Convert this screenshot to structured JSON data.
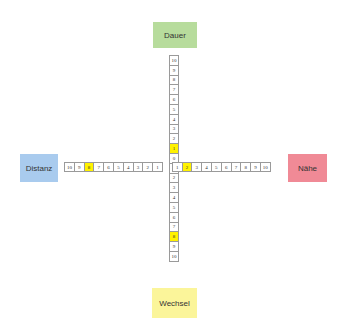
{
  "poles": {
    "top": "Dauer",
    "left": "Distanz",
    "right": "Nähe",
    "bottom": "Wechsel"
  },
  "colors": {
    "top": "#b7dc9c",
    "left": "#a9cbee",
    "right": "#f08a96",
    "bottom": "#fbf59a",
    "highlight": "#fff200"
  },
  "vertical_axis": [
    "10",
    "9",
    "8",
    "7",
    "6",
    "5",
    "4",
    "3",
    "2",
    "1",
    "0",
    "1",
    "2",
    "3",
    "4",
    "5",
    "6",
    "7",
    "8",
    "9",
    "10"
  ],
  "vertical_highlight": [
    9,
    18
  ],
  "horizontal_left": [
    "10",
    "9",
    "8",
    "7",
    "6",
    "5",
    "4",
    "3",
    "2",
    "1"
  ],
  "horizontal_right": [
    "1",
    "2",
    "3",
    "4",
    "5",
    "6",
    "7",
    "8",
    "9",
    "10"
  ],
  "horizontal_highlight_left": [
    2
  ],
  "horizontal_highlight_right": [
    1
  ],
  "marked_values": {
    "Dauer": 1,
    "Wechsel": 8,
    "Distanz": 8,
    "Nähe": 2
  }
}
